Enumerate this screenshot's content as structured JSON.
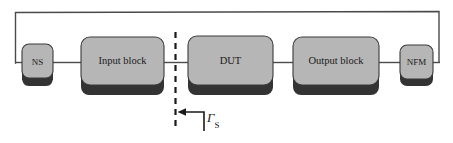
{
  "figure": {
    "type": "block-diagram",
    "background_color": "#ffffff"
  },
  "style": {
    "block_fill": "#b6b6b6",
    "block_stroke": "#3a3a3a",
    "block_shadow": "#333333",
    "wire_color": "#4a4a4a",
    "dashed_color": "#1a1a1a",
    "text_color": "#1a1a1a"
  },
  "blocks": [
    {
      "id": "ns",
      "label": "NS",
      "x": 22,
      "y": 44,
      "w": 31,
      "h": 33,
      "shadow_h": 9
    },
    {
      "id": "input",
      "label": "Input block",
      "x": 81,
      "y": 37,
      "w": 83,
      "h": 47,
      "shadow_h": 11
    },
    {
      "id": "dut",
      "label": "DUT",
      "x": 188,
      "y": 36,
      "w": 85,
      "h": 48,
      "shadow_h": 11
    },
    {
      "id": "output",
      "label": "Output block",
      "x": 293,
      "y": 37,
      "w": 86,
      "h": 47,
      "shadow_h": 11
    },
    {
      "id": "nfm",
      "label": "NFM",
      "x": 400,
      "y": 45,
      "w": 33,
      "h": 33,
      "shadow_h": 9
    }
  ],
  "connections": [
    {
      "id": "ns-to-input",
      "from": "ns",
      "to": "input"
    },
    {
      "id": "input-to-dut",
      "from": "input",
      "to": "dut"
    },
    {
      "id": "dut-to-output",
      "from": "dut",
      "to": "output"
    },
    {
      "id": "output-to-nfm",
      "from": "output",
      "to": "nfm"
    },
    {
      "id": "feedback-loop",
      "from": "nfm",
      "to": "ns",
      "routing": "top"
    }
  ],
  "reference_plane": {
    "id": "gamma-s-plane",
    "style": "dashed",
    "x": 175,
    "y_top": 32,
    "y_bottom": 131
  },
  "annotation": {
    "symbol": "Γ",
    "subscript": "S",
    "full_label": "ΓS",
    "arrow_direction": "left",
    "points_to": "gamma-s-plane"
  }
}
